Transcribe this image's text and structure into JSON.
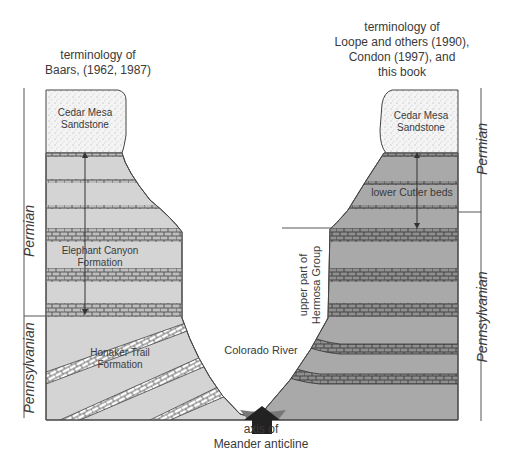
{
  "headers": {
    "left": [
      "terminology of",
      "Baars, (1962, 1987)"
    ],
    "right": [
      "terminology of",
      "Loope and others (1990),",
      "Condon (1997), and",
      "this book"
    ]
  },
  "left_column": {
    "periods": [
      "Permian",
      "Pennsylvanian"
    ],
    "units": {
      "cedar_mesa": [
        "Cedar Mesa",
        "Sandstone"
      ],
      "elephant_canyon": [
        "Elephant Canyon",
        "Formation"
      ],
      "honaker_trail": [
        "Honaker Trail",
        "Formation"
      ]
    }
  },
  "right_column": {
    "periods": [
      "Permian",
      "Pennsylvanian"
    ],
    "units": {
      "cedar_mesa": [
        "Cedar Mesa",
        "Sandstone"
      ],
      "lower_cutler": "lower Cutler beds",
      "hermosa": [
        "upper part of",
        "Hermosa Group"
      ]
    }
  },
  "center": {
    "river": "Colorado River",
    "axis": [
      "axis of",
      "Meander anticline"
    ]
  },
  "colors": {
    "sandstone": "#f2f2f2",
    "left_shale": "#d4d4d4",
    "right_shale": "#a9a9a9",
    "limestone_left": "#bdbdbd",
    "limestone_right": "#8f8f8f",
    "outline": "#444444",
    "arrow": "#222222"
  }
}
